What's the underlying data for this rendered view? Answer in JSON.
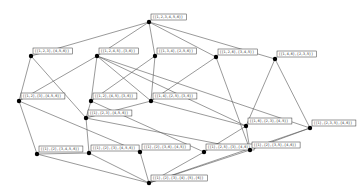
{
  "diagram": {
    "type": "hasse-diagram",
    "background": "#ffffff",
    "edge_color": "#555555",
    "node_color": "#000000",
    "nodes": [
      {
        "id": "top",
        "x": 149,
        "y": 22,
        "label": "{{1,2,3,4,5,6}}"
      },
      {
        "id": "a1",
        "x": 31,
        "y": 56,
        "label": "{{1,2,3},{4,5,6}}"
      },
      {
        "id": "a2",
        "x": 97,
        "y": 56,
        "label": "{{1,2,4,5},{3,6}}"
      },
      {
        "id": "a3",
        "x": 155,
        "y": 56,
        "label": "{{1,3,4},{2,5,6}}"
      },
      {
        "id": "a4",
        "x": 216,
        "y": 57,
        "label": "{{1,2,6},{3,4,5}}"
      },
      {
        "id": "a5",
        "x": 275,
        "y": 59,
        "label": "{{1,4,6},{2,3,5}}"
      },
      {
        "id": "b1",
        "x": 19,
        "y": 101,
        "label": "{{1,2},{3},{4,5,6}}"
      },
      {
        "id": "b2",
        "x": 91,
        "y": 101,
        "label": "{{1,2},{4,5},{3,6}}"
      },
      {
        "id": "b3",
        "x": 151,
        "y": 101,
        "label": "{{1,4},{2,5},{3,6}}"
      },
      {
        "id": "c1",
        "x": 86,
        "y": 118,
        "label": "{{1},{2,3},{4,5,6}}"
      },
      {
        "id": "c2",
        "x": 246,
        "y": 126,
        "label": "{{1,6},{2,3},{4,5}}"
      },
      {
        "id": "c3",
        "x": 310,
        "y": 128,
        "label": "{{1},{2,3,5},{4,6}}"
      },
      {
        "id": "d1",
        "x": 37,
        "y": 154,
        "label": "{{1},{2},{3,4,5,6}}"
      },
      {
        "id": "d2",
        "x": 89,
        "y": 153,
        "label": "{{1},{2},{3},{4,5,6}}"
      },
      {
        "id": "d3",
        "x": 140,
        "y": 152,
        "label": "{{1},{2},{3,6},{4,5}}"
      },
      {
        "id": "d4",
        "x": 204,
        "y": 152,
        "label": "{{1},{2,5},{3},{4,6}}"
      },
      {
        "id": "d5",
        "x": 250,
        "y": 150,
        "label": "{{1},{2},{3,5},{4,6}}"
      },
      {
        "id": "bottom",
        "x": 149,
        "y": 183,
        "label": "{{1},{2},{3},{4},{5},{6}}"
      }
    ],
    "edges": [
      [
        "top",
        "a1"
      ],
      [
        "top",
        "a2"
      ],
      [
        "top",
        "a3"
      ],
      [
        "top",
        "a4"
      ],
      [
        "top",
        "a5"
      ],
      [
        "a1",
        "b1"
      ],
      [
        "a1",
        "c1"
      ],
      [
        "a2",
        "b1"
      ],
      [
        "a2",
        "b2"
      ],
      [
        "a2",
        "b3"
      ],
      [
        "a2",
        "c2"
      ],
      [
        "a2",
        "c3"
      ],
      [
        "a3",
        "b2"
      ],
      [
        "a3",
        "b3"
      ],
      [
        "a4",
        "b3"
      ],
      [
        "a4",
        "d5"
      ],
      [
        "a5",
        "c2"
      ],
      [
        "a5",
        "c3"
      ],
      [
        "b1",
        "d1"
      ],
      [
        "b1",
        "d3"
      ],
      [
        "b2",
        "c1"
      ],
      [
        "b2",
        "d4"
      ],
      [
        "b3",
        "c1"
      ],
      [
        "b3",
        "c2"
      ],
      [
        "c1",
        "d2"
      ],
      [
        "c1",
        "d5"
      ],
      [
        "c2",
        "d4"
      ],
      [
        "c2",
        "d5"
      ],
      [
        "c3",
        "d5"
      ],
      [
        "c3",
        "bottom"
      ],
      [
        "d1",
        "bottom"
      ],
      [
        "d2",
        "d1"
      ],
      [
        "d3",
        "bottom"
      ],
      [
        "d4",
        "bottom"
      ],
      [
        "d5",
        "bottom"
      ],
      [
        "d2",
        "bottom"
      ]
    ]
  }
}
